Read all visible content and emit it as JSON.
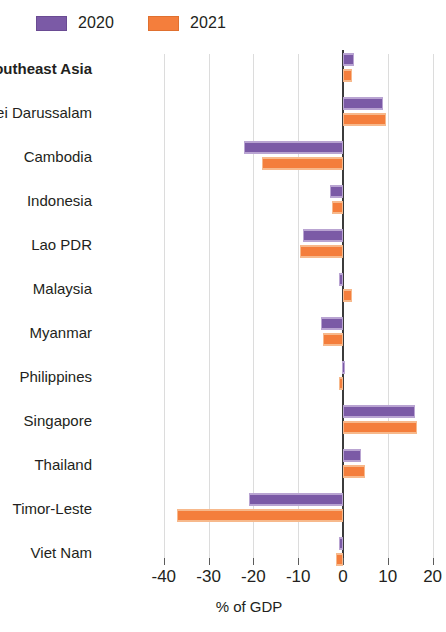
{
  "legend": {
    "items": [
      {
        "label": "2020",
        "key": "s2020",
        "color": "#7B5AA6"
      },
      {
        "label": "2021",
        "key": "s2021",
        "color": "#F47E3C"
      }
    ]
  },
  "axis": {
    "title": "% of GDP",
    "ticks": [
      "-40",
      "-30",
      "-20",
      "-10",
      "0",
      "10",
      "20"
    ]
  },
  "chart_data": {
    "type": "bar",
    "orientation": "horizontal",
    "title": "",
    "subtitle": "",
    "xlabel": "% of GDP",
    "ylabel": "",
    "xlim": [
      -40,
      20
    ],
    "xticks": [
      -40,
      -30,
      -20,
      -10,
      0,
      10,
      20
    ],
    "grid": true,
    "legend_position": "top-left",
    "categories": [
      "Southeast Asia",
      "Brunei Darussalam",
      "Cambodia",
      "Indonesia",
      "Lao PDR",
      "Malaysia",
      "Myanmar",
      "Philippines",
      "Singapore",
      "Thailand",
      "Timor-Leste",
      "Viet Nam"
    ],
    "emphasized_categories": [
      "Southeast Asia"
    ],
    "series": [
      {
        "name": "2020",
        "color": "#7B5AA6",
        "values": [
          2.5,
          9.0,
          -22.0,
          -3.0,
          -9.0,
          -1.0,
          -5.0,
          -0.3,
          16.0,
          4.0,
          -21.0,
          -1.0
        ]
      },
      {
        "name": "2021",
        "color": "#F47E3C",
        "values": [
          2.0,
          9.5,
          -18.0,
          -2.5,
          -9.5,
          2.0,
          -4.5,
          -1.0,
          16.5,
          5.0,
          -37.0,
          -1.5
        ]
      }
    ]
  }
}
